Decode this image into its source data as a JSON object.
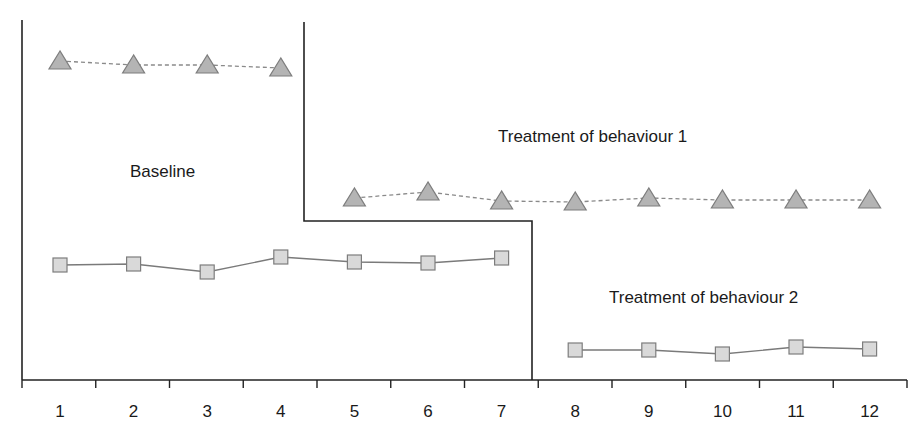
{
  "chart_data": {
    "type": "line",
    "title": "",
    "xlabel": "",
    "ylabel": "",
    "categories": [
      "1",
      "2",
      "3",
      "4",
      "5",
      "6",
      "7",
      "8",
      "9",
      "10",
      "11",
      "12"
    ],
    "x": [
      1,
      2,
      3,
      4,
      5,
      6,
      7,
      8,
      9,
      10,
      11,
      12
    ],
    "grid": false,
    "legend": "none",
    "y_units": "relative height above x-axis (no y tick labels shown)",
    "ylim": [
      0,
      360
    ],
    "series": [
      {
        "name": "Behaviour 1",
        "marker": "triangle",
        "line_style": "dashed",
        "color": "#b4b4b4",
        "values": [
          319,
          315,
          315,
          312,
          182,
          188,
          179,
          178,
          182,
          180,
          180,
          180
        ],
        "segments": [
          [
            1,
            4
          ],
          [
            5,
            12
          ]
        ]
      },
      {
        "name": "Behaviour 2",
        "marker": "square",
        "line_style": "solid",
        "color": "#d9d9d9",
        "values": [
          115,
          116,
          108,
          123,
          118,
          117,
          122,
          30,
          30,
          26,
          33,
          31
        ],
        "segments": [
          [
            1,
            7
          ],
          [
            8,
            12
          ]
        ]
      }
    ],
    "phase_change_lines": [
      {
        "behaviour": "Behaviour 1",
        "between_sessions": [
          4,
          5
        ]
      },
      {
        "behaviour": "Behaviour 2",
        "between_sessions": [
          7,
          8
        ]
      }
    ],
    "annotations": [
      {
        "text": "Baseline",
        "x_session": 2.05,
        "y": 210
      },
      {
        "text": "Treatment of behaviour 1",
        "x_session": 8.2,
        "y": 245
      },
      {
        "text": "Treatment of behaviour 2",
        "x_session": 9.85,
        "y": 82
      }
    ]
  },
  "labels": {
    "baseline": "Baseline",
    "treatment1": "Treatment of behaviour 1",
    "treatment2": "Treatment of behaviour 2"
  },
  "x_ticks": [
    "1",
    "2",
    "3",
    "4",
    "5",
    "6",
    "7",
    "8",
    "9",
    "10",
    "11",
    "12"
  ]
}
